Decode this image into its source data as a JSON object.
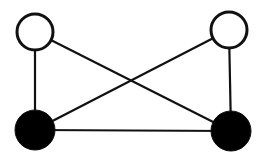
{
  "diagram": {
    "type": "graph",
    "colors": {
      "stroke": "#111111",
      "filled": "#000000",
      "hollow": "#ffffff",
      "background": "#ffffff"
    },
    "nodes": [
      {
        "id": "top-left",
        "x": 35,
        "y": 32,
        "r": 18,
        "fill": "hollow"
      },
      {
        "id": "top-right",
        "x": 229,
        "y": 30,
        "r": 18,
        "fill": "hollow"
      },
      {
        "id": "bottom-left",
        "x": 35,
        "y": 130,
        "r": 20,
        "fill": "filled"
      },
      {
        "id": "bottom-right",
        "x": 231,
        "y": 131,
        "r": 20,
        "fill": "filled"
      }
    ],
    "edges": [
      {
        "from": "top-left",
        "to": "bottom-left"
      },
      {
        "from": "top-right",
        "to": "bottom-right"
      },
      {
        "from": "bottom-left",
        "to": "bottom-right"
      },
      {
        "from": "top-left",
        "to": "bottom-right"
      },
      {
        "from": "top-right",
        "to": "bottom-left"
      }
    ]
  }
}
